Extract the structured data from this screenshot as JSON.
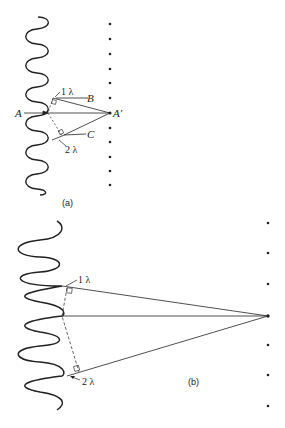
{
  "figure": {
    "panel_a": {
      "caption": "(a)",
      "labels": {
        "point_A": "A",
        "point_A_prime": "A′",
        "point_B": "B",
        "point_C": "C",
        "path_diff_1": "1 λ",
        "path_diff_2": "2 λ"
      },
      "dot_count": 13
    },
    "panel_b": {
      "caption": "(b)",
      "labels": {
        "path_diff_1": "1 λ",
        "path_diff_2": "2 λ"
      },
      "dot_count": 7
    },
    "colors": {
      "ink": "#222222",
      "background": "#ffffff"
    }
  }
}
